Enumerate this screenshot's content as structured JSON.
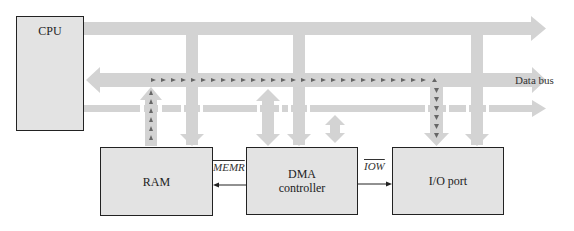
{
  "diagram": {
    "nodes": {
      "cpu": "CPU",
      "ram": "RAM",
      "dma_line1": "DMA",
      "dma_line2": "controller",
      "io": "I/O port"
    },
    "buses": {
      "data_bus": "Data bus"
    },
    "signals": {
      "memr": "MEMR",
      "iow": "IOW"
    },
    "colors": {
      "bus": "#d3d3d3",
      "box_fill": "#e3e3e3",
      "box_border": "#222222",
      "dotted_path": "#666666",
      "signal_line": "#222222"
    }
  }
}
